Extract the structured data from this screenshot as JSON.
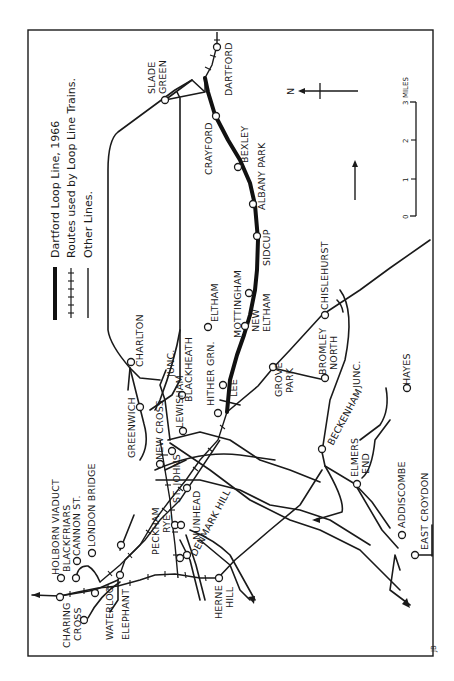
{
  "map": {
    "title": "Dartford Loop Line, 1966",
    "orientation": "rotated 90 degrees counter-clockwise",
    "legend": [
      {
        "symbol": "thick-line",
        "label": "Dartford Loop Line, 1966"
      },
      {
        "symbol": "ticked-line",
        "label": "Routes used by Loop Line Trains."
      },
      {
        "symbol": "thin-line",
        "label": "Other Lines."
      }
    ],
    "north_label": "N",
    "scale": {
      "unit": "MILES",
      "ticks": [
        "0",
        "1",
        "2",
        "3"
      ],
      "end_label": "3 MILES"
    },
    "credit": "JB",
    "stations": {
      "dartford": "DARTFORD",
      "slade_green": [
        "SLADE",
        "GREEN"
      ],
      "crayford": "CRAYFORD",
      "bexley": "BEXLEY",
      "albany_park": "ALBANY PARK",
      "sidcup": "SIDCUP",
      "new_eltham": [
        "NEW",
        "ELTHAM"
      ],
      "mottingham": "MOTTINGHAM",
      "lee": "LEE",
      "hither_green": "HITHER GRN.",
      "eltham": "ELTHAM",
      "blackheath": "BLACKHEATH",
      "lewisham_junc": [
        "LEWISHAM",
        "JUNC."
      ],
      "charlton": "CHARLTON",
      "greenwich": "GREENWICH",
      "new_cross": "NEW CROSS",
      "st_johns": "ST. JOHNS",
      "nunhead": "NUNHEAD",
      "peckham_rye": [
        "PECKHAM",
        "RYE"
      ],
      "denmark_hill": "DENMARK HILL",
      "herne_hill": [
        "HERNE",
        "HILL"
      ],
      "london_bridge": "LONDON BRIDGE",
      "cannon_st": "CANNON ST.",
      "blackfriars": "BLACKFRIARS",
      "holborn_viaduct": "HOLBORN VIADUCT",
      "charing_cross": [
        "CHARING",
        "CROSS"
      ],
      "waterloo": "WATERLOO",
      "elephant": "ELEPHANT",
      "grove_park": [
        "GROVE",
        "PARK"
      ],
      "bromley_north": [
        "BROMLEY",
        "NORTH"
      ],
      "chislehurst": "CHISLEHURST",
      "beckenham_junc": [
        "BECKENHAM",
        "JUNC."
      ],
      "hayes": "HAYES",
      "elmers_end": [
        "ELMERS",
        "END"
      ],
      "addiscombe": "ADDISCOMBE",
      "east_croydon": "EAST CROYDON"
    }
  }
}
